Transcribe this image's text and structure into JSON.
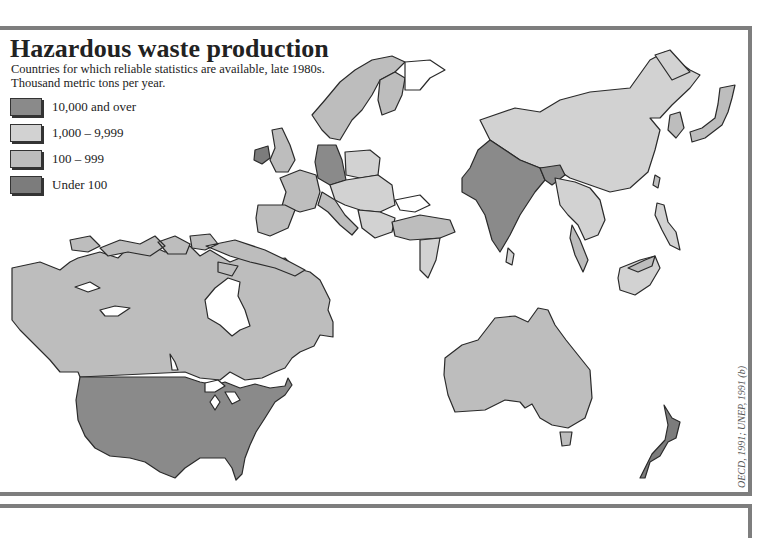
{
  "header": {
    "title": "Hazardous waste production",
    "subtitle_line1": "Countries for which reliable statistics are available, late 1980s.",
    "subtitle_line2": "Thousand metric tons per year."
  },
  "legend": {
    "items": [
      {
        "label": "10,000 and over",
        "color": "#8a8a8a"
      },
      {
        "label": "1,000 – 9,999",
        "color": "#d2d2d2"
      },
      {
        "label": "100 – 999",
        "color": "#bdbdbd"
      },
      {
        "label": "Under 100",
        "color": "#7c7c7c"
      }
    ]
  },
  "source": "OECD, 1991; UNEP, 1991 (b)",
  "colors": {
    "frame": "#7e7e7e",
    "outline": "#2a2a2a",
    "high": "#8a8a8a",
    "mid_high": "#d2d2d2",
    "mid": "#bdbdbd",
    "low": "#7c7c7c"
  },
  "regions": [
    {
      "name": "United States",
      "category": "10,000 and over"
    },
    {
      "name": "Canada",
      "category": "100 – 999"
    },
    {
      "name": "India",
      "category": "10,000 and over"
    },
    {
      "name": "Germany",
      "category": "10,000 and over"
    },
    {
      "name": "China",
      "category": "1,000 – 9,999"
    },
    {
      "name": "Australia",
      "category": "100 – 999"
    },
    {
      "name": "New Zealand",
      "category": "Under 100"
    },
    {
      "name": "Ireland",
      "category": "Under 100"
    },
    {
      "name": "Japan",
      "category": "100 – 999"
    }
  ]
}
